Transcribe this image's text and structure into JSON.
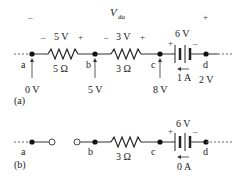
{
  "panel_a": {
    "caption": "(a)",
    "vda_label": "V",
    "vda_sub": "da",
    "vda_minus": "–",
    "vda_plus": "+",
    "nodes": {
      "a": "a",
      "b": "b",
      "c": "c",
      "d": "d"
    },
    "resistor1": {
      "value": "5 Ω",
      "voltage": "5 V",
      "minus": "–",
      "plus": "+"
    },
    "resistor2": {
      "value": "3 Ω",
      "voltage": "3 V",
      "minus": "–",
      "plus": "+"
    },
    "battery": {
      "voltage": "6 V",
      "plus": "+",
      "minus": "–",
      "current": "1 A"
    },
    "node_voltages": {
      "a": "0 V",
      "b": "5 V",
      "c": "8 V",
      "d": "2 V"
    }
  },
  "panel_b": {
    "caption": "(b)",
    "nodes": {
      "a": "a",
      "b": "b",
      "c": "c",
      "d": "d"
    },
    "resistor": {
      "value": "3 Ω"
    },
    "battery": {
      "voltage": "6 V",
      "plus": "+",
      "minus": "–",
      "current": "0 A"
    }
  }
}
